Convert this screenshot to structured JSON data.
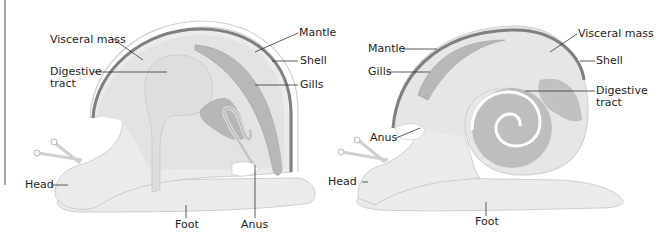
{
  "figure": {
    "colors": {
      "body": "#ebebeb",
      "body_outline": "#c4c4c4",
      "shell_band": "#7f7f7f",
      "shell_outer": "#d6d6d6",
      "visceral": "#e0e0e0",
      "digestive_dark": "#a8a8a8",
      "leader_line": "#333333",
      "text": "#1e1e1e"
    }
  },
  "left_snail": {
    "labels": {
      "visceral_mass": "Visceral mass",
      "digestive_tract_1": "Digestive",
      "digestive_tract_2": "tract",
      "mantle": "Mantle",
      "shell": "Shell",
      "gills": "Gills",
      "head": "Head",
      "foot": "Foot",
      "anus": "Anus"
    }
  },
  "right_snail": {
    "labels": {
      "mantle": "Mantle",
      "gills": "Gills",
      "visceral_mass": "Visceral mass",
      "shell": "Shell",
      "digestive_tract_1": "Digestive",
      "digestive_tract_2": "tract",
      "anus": "Anus",
      "head": "Head",
      "foot": "Foot"
    }
  }
}
